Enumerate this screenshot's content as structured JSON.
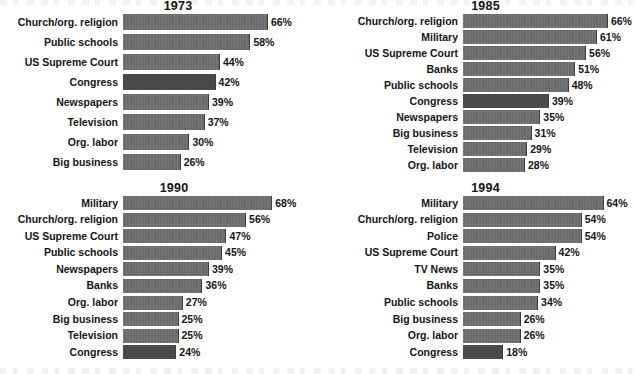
{
  "chart_data": [
    {
      "type": "bar",
      "title": "1973",
      "orientation": "horizontal",
      "xlabel": "",
      "ylabel": "",
      "xlim": [
        0,
        100
      ],
      "value_suffix": "%",
      "grid": false,
      "legend": "none",
      "categories": [
        "Church/org. religion",
        "Public schools",
        "US Supreme Court",
        "Congress",
        "Newspapers",
        "Television",
        "Org. labor",
        "Big business"
      ],
      "values": [
        66,
        58,
        44,
        42,
        39,
        37,
        30,
        26
      ],
      "value_labels": [
        "66%",
        "58%",
        "44%",
        "42%",
        "39%",
        "37%",
        "30%",
        "26%"
      ],
      "highlight_category": "Congress"
    },
    {
      "type": "bar",
      "title": "1985",
      "orientation": "horizontal",
      "xlabel": "",
      "ylabel": "",
      "xlim": [
        0,
        100
      ],
      "value_suffix": "%",
      "grid": false,
      "legend": "none",
      "categories": [
        "Church/org. religion",
        "Military",
        "US Supreme Court",
        "Banks",
        "Public schools",
        "Congress",
        "Newspapers",
        "Big business",
        "Television",
        "Org. labor"
      ],
      "values": [
        66,
        61,
        56,
        51,
        48,
        39,
        35,
        31,
        29,
        28
      ],
      "value_labels": [
        "66%",
        "61%",
        "56%",
        "51%",
        "48%",
        "39%",
        "35%",
        "31%",
        "29%",
        "28%"
      ],
      "highlight_category": "Congress"
    },
    {
      "type": "bar",
      "title": "1990",
      "orientation": "horizontal",
      "xlabel": "",
      "ylabel": "",
      "xlim": [
        0,
        100
      ],
      "value_suffix": "%",
      "grid": false,
      "legend": "none",
      "categories": [
        "Military",
        "Church/org. religion",
        "US Supreme Court",
        "Public schools",
        "Newspapers",
        "Banks",
        "Org. labor",
        "Big business",
        "Television",
        "Congress"
      ],
      "values": [
        68,
        56,
        47,
        45,
        39,
        36,
        27,
        25,
        25,
        24
      ],
      "value_labels": [
        "68%",
        "56%",
        "47%",
        "45%",
        "39%",
        "36%",
        "27%",
        "25%",
        "25%",
        "24%"
      ],
      "highlight_category": "Congress"
    },
    {
      "type": "bar",
      "title": "1994",
      "orientation": "horizontal",
      "xlabel": "",
      "ylabel": "",
      "xlim": [
        0,
        100
      ],
      "value_suffix": "%",
      "grid": false,
      "legend": "none",
      "categories": [
        "Military",
        "Church/org. religion",
        "Police",
        "US Supreme Court",
        "TV News",
        "Banks",
        "Public schools",
        "Big business",
        "Org. labor",
        "Congress"
      ],
      "values": [
        64,
        54,
        54,
        42,
        35,
        35,
        34,
        26,
        26,
        18
      ],
      "value_labels": [
        "64%",
        "54%",
        "54%",
        "42%",
        "35%",
        "35%",
        "34%",
        "26%",
        "26%",
        "18%"
      ],
      "highlight_category": "Congress"
    }
  ],
  "style": {
    "bar_color": "#6e6e6e",
    "bar_highlight_color": "#4a4a4a",
    "text_color": "#141414",
    "background": "#ffffff",
    "px_per_percent": 2.18
  }
}
